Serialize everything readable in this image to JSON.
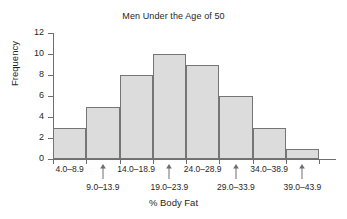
{
  "chart_data": {
    "type": "bar",
    "title": "Men Under the Age of 50",
    "xlabel": "% Body Fat",
    "ylabel": "Frequency",
    "categories": [
      "4.0–8.9",
      "9.0–13.9",
      "14.0–18.9",
      "19.0–23.9",
      "24.0–28.9",
      "29.0–33.9",
      "34.0–38.9",
      "39.0–43.9"
    ],
    "values": [
      3,
      5,
      8,
      10,
      9,
      6,
      3,
      1
    ],
    "ylim": [
      0,
      12
    ],
    "yticks": [
      0,
      2,
      4,
      6,
      8,
      10,
      12
    ],
    "ytick_labels": [
      "0",
      "2",
      "4",
      "6",
      "8",
      "10",
      "12"
    ],
    "grid": false,
    "legend": "none",
    "bar_fill": "#dcdcdc",
    "bar_edge": "#757575",
    "axis_color": "#6e6e6e",
    "background": "#ffffff",
    "label_stagger": [
      "top",
      "bottom",
      "top",
      "bottom",
      "top",
      "bottom",
      "top",
      "bottom"
    ]
  }
}
